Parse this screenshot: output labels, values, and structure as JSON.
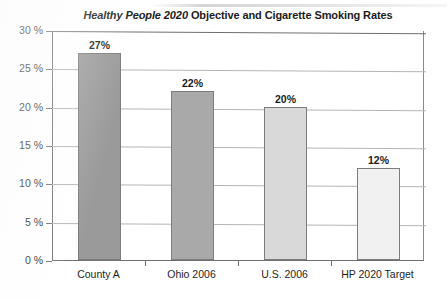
{
  "chart_data": {
    "type": "bar",
    "title": "Healthy People 2020 Objective and Cigarette Smoking Rates",
    "title_italic_part": "Healthy People 2020",
    "title_regular_part": " Objective and Cigarette Smoking Rates",
    "categories": [
      "County A",
      "Ohio 2006",
      "U.S. 2006",
      "HP 2020 Target"
    ],
    "values": [
      27,
      22,
      20,
      12
    ],
    "data_labels": [
      "27%",
      "22%",
      "20%",
      "12%"
    ],
    "xlabel": "",
    "ylabel": "",
    "ylim": [
      0,
      30
    ],
    "ytick_values": [
      0,
      5,
      10,
      15,
      20,
      25,
      30
    ],
    "ytick_labels": [
      "0 %",
      "5 %",
      "10 %",
      "15 %",
      "20 %",
      "25 %",
      "30 %"
    ],
    "grid": true,
    "legend": false,
    "bar_colors": [
      "#9a9a9a",
      "#a9a9a9",
      "#d9d9d9",
      "#f1f1f1"
    ],
    "bar_border_color": "#7c7c7c",
    "gridline_color": "#b4b4b4",
    "axis_color": "#6f6f6f",
    "background_color": "#ffffff"
  }
}
